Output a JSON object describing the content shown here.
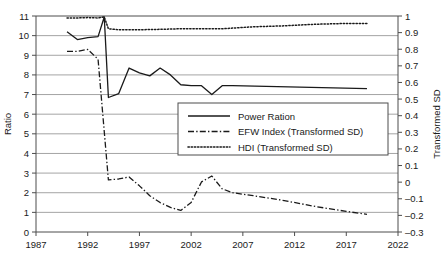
{
  "chart_data": {
    "type": "line",
    "title": "",
    "xlabel": "",
    "ylabel": "Ratio",
    "y2label": "Transformed SD",
    "xlim": [
      1987,
      2022
    ],
    "ylim": [
      0,
      11
    ],
    "y2lim": [
      -0.3,
      1.0
    ],
    "xticks": [
      1987,
      1992,
      1997,
      2002,
      2007,
      2012,
      2017,
      2022
    ],
    "yticks": [
      0,
      1,
      2,
      3,
      4,
      5,
      6,
      7,
      8,
      9,
      10,
      11
    ],
    "y2ticks": [
      -0.3,
      -0.2,
      -0.1,
      0,
      0.1,
      0.2,
      0.3,
      0.4,
      0.5,
      0.6,
      0.7,
      0.8,
      0.9,
      1
    ],
    "xtick_labels": [
      "1987",
      "1992",
      "1997",
      "2002",
      "2007",
      "2012",
      "2017",
      "2022"
    ],
    "ytick_labels": [
      "0",
      "1",
      "2",
      "3",
      "4",
      "5",
      "6",
      "7",
      "8",
      "9",
      "10",
      "11"
    ],
    "y2tick_labels": [
      "–0.3",
      "–0.2",
      "–0.1",
      "0",
      "0.1",
      "0.2",
      "0.3",
      "0.4",
      "0.5",
      "0.6",
      "0.7",
      "0.8",
      "0.9",
      "1"
    ],
    "grid": true,
    "grid_axis": "y",
    "legend_position": "center",
    "series": [
      {
        "name": "Power Ration",
        "axis": "left",
        "style": "solid",
        "color": "#1a1a1a",
        "points": [
          [
            1990,
            10.2
          ],
          [
            1991,
            9.8
          ],
          [
            1992,
            9.9
          ],
          [
            1993,
            9.95
          ],
          [
            1993.6,
            10.95
          ],
          [
            1994,
            6.85
          ],
          [
            1995,
            7.05
          ],
          [
            1996,
            8.35
          ],
          [
            1997,
            8.1
          ],
          [
            1998,
            7.95
          ],
          [
            1999,
            8.35
          ],
          [
            2000,
            8.0
          ],
          [
            2001,
            7.5
          ],
          [
            2002,
            7.45
          ],
          [
            2003,
            7.45
          ],
          [
            2004,
            7.0
          ],
          [
            2005,
            7.45
          ],
          [
            2006,
            7.45
          ],
          [
            2019,
            7.3
          ]
        ]
      },
      {
        "name": "EFW Index (Transformed SD)",
        "axis": "left",
        "style": "dashdot",
        "color": "#1a1a1a",
        "points": [
          [
            1990,
            9.2
          ],
          [
            1991,
            9.2
          ],
          [
            1992,
            9.3
          ],
          [
            1993,
            8.8
          ],
          [
            1994,
            2.65
          ],
          [
            1995,
            2.7
          ],
          [
            1996,
            2.8
          ],
          [
            1997,
            2.35
          ],
          [
            1998,
            1.85
          ],
          [
            1999,
            1.5
          ],
          [
            2000,
            1.25
          ],
          [
            2001,
            1.1
          ],
          [
            2002,
            1.5
          ],
          [
            2003,
            2.55
          ],
          [
            2004,
            2.85
          ],
          [
            2005,
            2.2
          ],
          [
            2006,
            2.0
          ],
          [
            2008,
            1.85
          ],
          [
            2011,
            1.6
          ],
          [
            2014,
            1.3
          ],
          [
            2017,
            1.05
          ],
          [
            2019,
            0.9
          ]
        ]
      },
      {
        "name": "HDI (Transformed SD)",
        "axis": "left",
        "style": "dotted",
        "color": "#1a1a1a",
        "points": [
          [
            1990,
            10.9
          ],
          [
            1991,
            10.9
          ],
          [
            1992,
            10.92
          ],
          [
            1993,
            10.9
          ],
          [
            1993.6,
            10.95
          ],
          [
            1994,
            10.35
          ],
          [
            1995,
            10.3
          ],
          [
            1996,
            10.3
          ],
          [
            1997,
            10.3
          ],
          [
            1999,
            10.32
          ],
          [
            2001,
            10.35
          ],
          [
            2003,
            10.35
          ],
          [
            2005,
            10.35
          ],
          [
            2008,
            10.45
          ],
          [
            2011,
            10.5
          ],
          [
            2014,
            10.58
          ],
          [
            2017,
            10.62
          ],
          [
            2019,
            10.62
          ]
        ]
      }
    ]
  },
  "legend": {
    "entries": [
      {
        "label": "Power Ration",
        "style": "solid"
      },
      {
        "label": "EFW Index (Transformed SD)",
        "style": "dashdot"
      },
      {
        "label": "HDI (Transformed SD)",
        "style": "dotted"
      }
    ]
  },
  "colors": {
    "ink": "#1a1a1a",
    "grid": "#9a9a9a",
    "axis": "#4d4d4d",
    "background": "#ffffff"
  }
}
